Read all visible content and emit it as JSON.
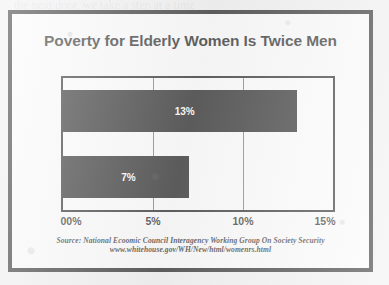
{
  "chart_data": {
    "type": "bar",
    "orientation": "horizontal",
    "title": "Poverty for Elderly Women Is Twice Men",
    "categories": [
      "Elderly Women",
      "Elderly Men"
    ],
    "values": [
      13,
      7
    ],
    "data_labels": [
      "13%",
      "7%"
    ],
    "xlabel": "",
    "ylabel": "",
    "xlim": [
      0,
      15
    ],
    "xticks": [
      0,
      5,
      10,
      15
    ],
    "xtick_labels": [
      "00%",
      "5%",
      "10%",
      "15%"
    ],
    "grid": true,
    "gridlines_at": [
      5,
      10
    ],
    "legend": false,
    "bar_color": "#111111",
    "plot_background": "#fdfdfd",
    "axis_color": "#141414"
  },
  "figure": {
    "title": "Poverty for Elderly Women Is Twice Men",
    "frame_color": "#121212",
    "page_background": "#efefef"
  },
  "source": {
    "line1": "Source: National Ecoomic Council Interagency Working Group On Society Security",
    "line2": "www.whitehouse.gov/WH/New/html/womenrs.html"
  }
}
